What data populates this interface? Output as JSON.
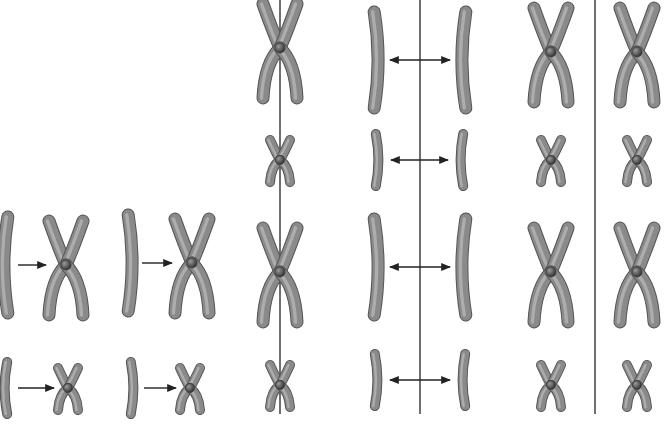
{
  "diagram": {
    "type": "chromosome-division-illustration",
    "colors": {
      "background": "#ffffff",
      "chromosome_fill": "#8a8a8a",
      "chromosome_dark": "#555555",
      "chromosome_light": "#c4c4c4",
      "centromere": "#3a3a3a",
      "line": "#222222"
    },
    "panels": [
      {
        "id": "replication",
        "description": "Unreplicated chromosomes become replicated (X-shaped) chromosomes",
        "pairs": [
          {
            "from": "long-single",
            "to": "long-x",
            "x_from": 6,
            "x_to": 66,
            "y": 265
          },
          {
            "from": "long-single",
            "to": "long-x",
            "x_from": 130,
            "x_to": 192,
            "y": 263
          },
          {
            "from": "short-single",
            "to": "short-x",
            "x_from": 6,
            "x_to": 68,
            "y": 388
          },
          {
            "from": "short-single",
            "to": "short-x",
            "x_from": 132,
            "x_to": 190,
            "y": 388
          }
        ]
      },
      {
        "id": "metaphase-line",
        "line_x": 280,
        "chromosomes": [
          {
            "shape": "long-x",
            "x": 280,
            "y": 48
          },
          {
            "shape": "short-x",
            "x": 280,
            "y": 160
          },
          {
            "shape": "long-x",
            "x": 280,
            "y": 272
          },
          {
            "shape": "short-x",
            "x": 280,
            "y": 385
          }
        ]
      },
      {
        "id": "anaphase-separation",
        "line_x": 420,
        "pairs": [
          {
            "shape": "long-single",
            "left_x": 376,
            "right_x": 464,
            "y": 60
          },
          {
            "shape": "short-single",
            "left_x": 377,
            "right_x": 462,
            "y": 160
          },
          {
            "shape": "long-single",
            "left_x": 376,
            "right_x": 464,
            "y": 267
          },
          {
            "shape": "short-single",
            "left_x": 376,
            "right_x": 464,
            "y": 380
          }
        ]
      },
      {
        "id": "daughter-cells",
        "line_x": 595,
        "chromosomes": [
          {
            "shape": "long-x",
            "x": 551,
            "y": 52
          },
          {
            "shape": "short-x",
            "x": 551,
            "y": 160
          },
          {
            "shape": "long-x",
            "x": 551,
            "y": 272
          },
          {
            "shape": "short-x",
            "x": 551,
            "y": 385
          },
          {
            "shape": "long-x",
            "x": 637,
            "y": 52
          },
          {
            "shape": "short-x",
            "x": 637,
            "y": 160
          },
          {
            "shape": "long-x",
            "x": 637,
            "y": 272
          },
          {
            "shape": "short-x",
            "x": 637,
            "y": 385
          }
        ]
      }
    ]
  }
}
